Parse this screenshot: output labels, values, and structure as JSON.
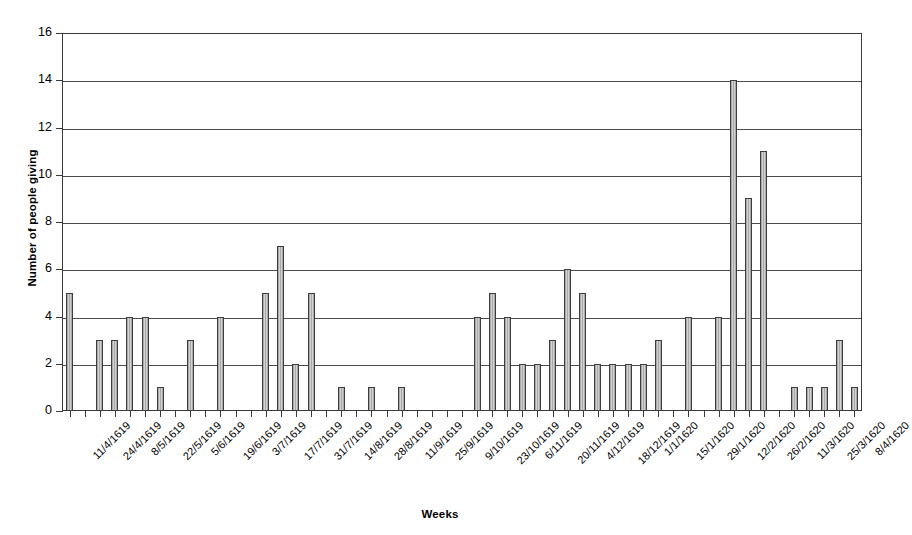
{
  "chart_data": {
    "type": "bar",
    "title": "",
    "xlabel": "Weeks",
    "ylabel": "Number of people giving",
    "ylim": [
      0,
      16
    ],
    "ytick_step": 2,
    "yticks": [
      16,
      14,
      12,
      10,
      8,
      6,
      4,
      2,
      0
    ],
    "grid": true,
    "legend": false,
    "bar_color": "#b8b8b8",
    "bar_edge_color": "#3d3d3d",
    "axis_color": "#3a3a3a",
    "tick_label_interval": 2,
    "categories": [
      "11/4/1619",
      "18/4/1619",
      "24/4/1619",
      "1/5/1619",
      "8/5/1619",
      "15/5/1619",
      "22/5/1619",
      "29/5/1619",
      "5/6/1619",
      "12/6/1619",
      "19/6/1619",
      "26/6/1619",
      "3/7/1619",
      "10/7/1619",
      "17/7/1619",
      "24/7/1619",
      "31/7/1619",
      "7/8/1619",
      "14/8/1619",
      "21/8/1619",
      "28/8/1619",
      "4/9/1619",
      "11/9/1619",
      "18/9/1619",
      "25/9/1619",
      "2/10/1619",
      "9/10/1619",
      "16/10/1619",
      "23/10/1619",
      "30/10/1619",
      "6/11/1619",
      "13/11/1619",
      "20/11/1619",
      "27/11/1619",
      "4/12/1619",
      "11/12/1619",
      "18/12/1619",
      "25/12/1619",
      "1/1/1620",
      "8/1/1620",
      "15/1/1620",
      "22/1/1620",
      "29/1/1620",
      "5/2/1620",
      "12/2/1620",
      "19/2/1620",
      "26/2/1620",
      "4/3/1620",
      "11/3/1620",
      "18/3/1620",
      "25/3/1620",
      "1/4/1620",
      "8/4/1620"
    ],
    "values": [
      5,
      0,
      3,
      3,
      4,
      4,
      1,
      0,
      3,
      0,
      4,
      0,
      0,
      5,
      7,
      2,
      5,
      0,
      1,
      0,
      1,
      0,
      1,
      0,
      0,
      0,
      0,
      4,
      5,
      4,
      2,
      2,
      3,
      6,
      5,
      2,
      2,
      2,
      2,
      3,
      0,
      4,
      0,
      4,
      14,
      9,
      11,
      0,
      1,
      1,
      1,
      3,
      1
    ],
    "tick_labels": [
      "11/4/1619",
      "24/4/1619",
      "8/5/1619",
      "22/5/1619",
      "5/6/1619",
      "19/6/1619",
      "3/7/1619",
      "17/7/1619",
      "31/7/1619",
      "14/8/1619",
      "28/8/1619",
      "11/9/1619",
      "25/9/1619",
      "9/10/1619",
      "23/10/1619",
      "6/11/1619",
      "20/11/1619",
      "4/12/1619",
      "18/12/1619",
      "1/1/1620",
      "15/1/1620",
      "29/1/1620",
      "12/2/1620",
      "26/2/1620",
      "11/3/1620",
      "25/3/1620",
      "8/4/1620"
    ],
    "extra_values": [
      5,
      2,
      5,
      2,
      1,
      3,
      2,
      1
    ]
  },
  "axes": {
    "y_title": "Number of people giving",
    "x_title": "Weeks"
  }
}
